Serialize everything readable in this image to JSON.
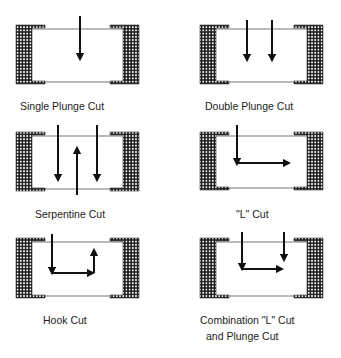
{
  "diagram": {
    "type": "laser-trim-cut-types",
    "panels": [
      {
        "id": "single-plunge",
        "label": "Single Plunge Cut",
        "body": {
          "x": 16,
          "y": 25,
          "w": 123,
          "h": 59
        },
        "cuts": [
          {
            "kind": "arrow",
            "points": [
              [
                80,
                16
              ],
              [
                80,
                57
              ]
            ]
          }
        ]
      },
      {
        "id": "double-plunge",
        "label": "Double Plunge Cut",
        "body": {
          "x": 200,
          "y": 25,
          "w": 123,
          "h": 59
        },
        "cuts": [
          {
            "kind": "arrow",
            "points": [
              [
                247,
                20
              ],
              [
                247,
                58
              ]
            ]
          },
          {
            "kind": "arrow",
            "points": [
              [
                272,
                20
              ],
              [
                272,
                58
              ]
            ]
          }
        ]
      },
      {
        "id": "serpentine",
        "label": "Serpentine Cut",
        "body": {
          "x": 16,
          "y": 132,
          "w": 123,
          "h": 59
        },
        "cuts": [
          {
            "kind": "arrow",
            "points": [
              [
                58,
                125
              ],
              [
                58,
                178
              ]
            ]
          },
          {
            "kind": "arrow",
            "points": [
              [
                77,
                195
              ],
              [
                77,
                150
              ]
            ]
          },
          {
            "kind": "arrow",
            "points": [
              [
                97,
                125
              ],
              [
                97,
                178
              ]
            ]
          }
        ]
      },
      {
        "id": "l-cut",
        "label": "\"L\" Cut",
        "body": {
          "x": 200,
          "y": 132,
          "w": 123,
          "h": 58
        },
        "cuts": [
          {
            "kind": "arrow",
            "points": [
              [
                237,
                125
              ],
              [
                237,
                162
              ]
            ]
          },
          {
            "kind": "arrow",
            "points": [
              [
                237,
                163
              ],
              [
                287,
                163
              ]
            ]
          }
        ]
      },
      {
        "id": "hook",
        "label": "Hook Cut",
        "body": {
          "x": 16,
          "y": 238,
          "w": 123,
          "h": 60
        },
        "cuts": [
          {
            "kind": "arrow",
            "points": [
              [
                52,
                234
              ],
              [
                52,
                271
              ]
            ]
          },
          {
            "kind": "arrow",
            "points": [
              [
                52,
                273
              ],
              [
                91,
                273
              ]
            ]
          },
          {
            "kind": "arrow",
            "points": [
              [
                94,
                273
              ],
              [
                94,
                252
              ]
            ]
          }
        ]
      },
      {
        "id": "combination",
        "label_line1": "Combination \"L\" Cut",
        "label_line2": "and Plunge Cut",
        "body": {
          "x": 200,
          "y": 238,
          "w": 123,
          "h": 60
        },
        "cuts": [
          {
            "kind": "arrow",
            "points": [
              [
                242,
                232
              ],
              [
                242,
                267
              ]
            ]
          },
          {
            "kind": "arrow",
            "points": [
              [
                242,
                269
              ],
              [
                280,
                269
              ]
            ]
          },
          {
            "kind": "arrow",
            "points": [
              [
                284,
                232
              ],
              [
                284,
                258
              ]
            ]
          }
        ]
      }
    ],
    "colors": {
      "ink": "#111111",
      "hatch": "#1a1a1a",
      "line": "#777777",
      "background": "#ffffff"
    }
  }
}
